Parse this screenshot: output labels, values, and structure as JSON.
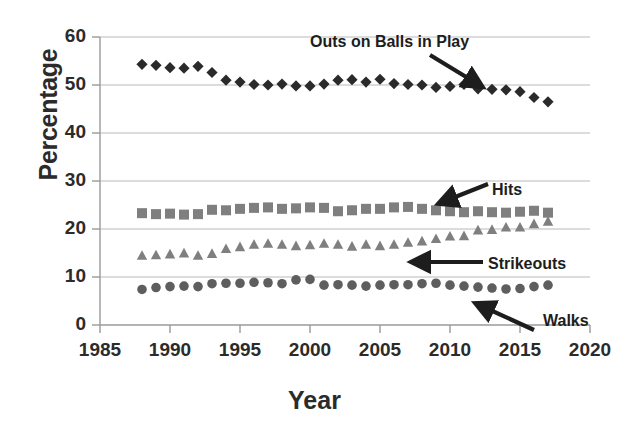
{
  "chart_data": {
    "type": "scatter",
    "title": "",
    "xlabel": "Year",
    "ylabel": "Percentage",
    "xlim": [
      1985,
      2020
    ],
    "ylim": [
      0,
      60
    ],
    "xticks": [
      1985,
      1990,
      1995,
      2000,
      2005,
      2010,
      2015,
      2020
    ],
    "yticks": [
      0,
      10,
      20,
      30,
      40,
      50,
      60
    ],
    "grid": "horizontal",
    "legend": "none (inline arrow annotations)",
    "x": [
      1988,
      1989,
      1990,
      1991,
      1992,
      1993,
      1994,
      1995,
      1996,
      1997,
      1998,
      1999,
      2000,
      2001,
      2002,
      2003,
      2004,
      2005,
      2006,
      2007,
      2008,
      2009,
      2010,
      2011,
      2012,
      2013,
      2014,
      2015,
      2016,
      2017
    ],
    "series": [
      {
        "name": "Outs on Balls in Play",
        "marker": "diamond",
        "color": "#2a2a2a",
        "values": [
          54.3,
          54.1,
          53.6,
          53.5,
          53.9,
          52.6,
          51.0,
          50.6,
          50.1,
          50.0,
          50.2,
          49.8,
          49.8,
          50.2,
          51.0,
          51.1,
          50.6,
          51.2,
          50.3,
          50.1,
          50.0,
          49.5,
          49.7,
          50.1,
          49.2,
          49.1,
          49.0,
          48.6,
          47.4,
          46.5
        ]
      },
      {
        "name": "Hits",
        "marker": "square",
        "color": "#7f7f7f",
        "values": [
          23.3,
          23.1,
          23.2,
          23.0,
          23.1,
          24.0,
          23.9,
          24.2,
          24.4,
          24.5,
          24.2,
          24.3,
          24.5,
          24.4,
          23.7,
          23.9,
          24.2,
          24.2,
          24.5,
          24.6,
          24.2,
          23.9,
          23.7,
          23.5,
          23.7,
          23.5,
          23.4,
          23.6,
          23.8,
          23.4
        ]
      },
      {
        "name": "Strikeouts",
        "marker": "triangle",
        "color": "#7f7f7f",
        "values": [
          14.5,
          14.6,
          14.8,
          15.0,
          14.5,
          14.9,
          15.9,
          16.3,
          16.8,
          17.0,
          16.8,
          16.5,
          16.7,
          17.0,
          16.8,
          16.4,
          16.8,
          16.5,
          16.8,
          17.2,
          17.5,
          18.0,
          18.5,
          18.6,
          19.8,
          19.9,
          20.4,
          20.4,
          21.1,
          21.6
        ]
      },
      {
        "name": "Walks",
        "marker": "circle",
        "color": "#5e5e5e",
        "values": [
          7.4,
          7.8,
          8.0,
          8.1,
          8.0,
          8.6,
          8.7,
          8.7,
          8.9,
          8.8,
          8.6,
          9.4,
          9.5,
          8.3,
          8.4,
          8.3,
          8.1,
          8.3,
          8.4,
          8.4,
          8.6,
          8.7,
          8.3,
          8.1,
          7.9,
          7.7,
          7.5,
          7.6,
          8.0,
          8.3
        ]
      }
    ],
    "annotations": [
      {
        "label": "Outs on Balls in Play",
        "points_to": "diamond-series"
      },
      {
        "label": "Hits",
        "points_to": "square-series"
      },
      {
        "label": "Strikeouts",
        "points_to": "triangle-series"
      },
      {
        "label": "Walks",
        "points_to": "circle-series"
      }
    ]
  },
  "axes": {
    "y_title": "Percentage",
    "x_title": "Year",
    "y_ticks": [
      "60",
      "50",
      "40",
      "30",
      "20",
      "10",
      "0"
    ],
    "x_ticks": [
      "1985",
      "1990",
      "1995",
      "2000",
      "2005",
      "2010",
      "2015",
      "2020"
    ]
  },
  "annotations": {
    "outs": "Outs on Balls in Play",
    "hits": "Hits",
    "strikeouts": "Strikeouts",
    "walks": "Walks"
  },
  "colors": {
    "outs": "#2a2a2a",
    "hits": "#7f7f7f",
    "strikeouts": "#7f7f7f",
    "walks": "#5e5e5e",
    "grid": "#b9b9b9",
    "axis": "#9a9a9a",
    "text": "#2b2b2b"
  }
}
